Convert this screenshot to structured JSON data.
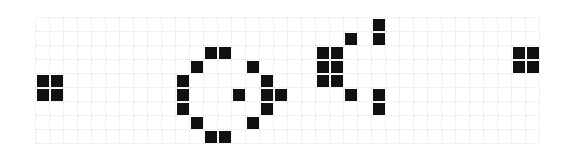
{
  "board": {
    "title": "Gosper glider gun",
    "columns": 36,
    "rows": 9,
    "cell_size_px": 14,
    "colors": {
      "alive": "#111111",
      "dead": "#ffffff",
      "grid_line": "#e6e6e6"
    },
    "alive_cells": [
      [
        0,
        4
      ],
      [
        0,
        5
      ],
      [
        1,
        4
      ],
      [
        1,
        5
      ],
      [
        10,
        4
      ],
      [
        10,
        5
      ],
      [
        10,
        6
      ],
      [
        11,
        3
      ],
      [
        11,
        7
      ],
      [
        12,
        2
      ],
      [
        12,
        8
      ],
      [
        13,
        2
      ],
      [
        13,
        8
      ],
      [
        14,
        5
      ],
      [
        15,
        3
      ],
      [
        15,
        7
      ],
      [
        16,
        4
      ],
      [
        16,
        5
      ],
      [
        16,
        6
      ],
      [
        17,
        5
      ],
      [
        20,
        2
      ],
      [
        20,
        3
      ],
      [
        20,
        4
      ],
      [
        21,
        2
      ],
      [
        21,
        3
      ],
      [
        21,
        4
      ],
      [
        22,
        1
      ],
      [
        22,
        5
      ],
      [
        24,
        0
      ],
      [
        24,
        1
      ],
      [
        24,
        5
      ],
      [
        24,
        6
      ],
      [
        34,
        2
      ],
      [
        34,
        3
      ],
      [
        35,
        2
      ],
      [
        35,
        3
      ]
    ]
  }
}
